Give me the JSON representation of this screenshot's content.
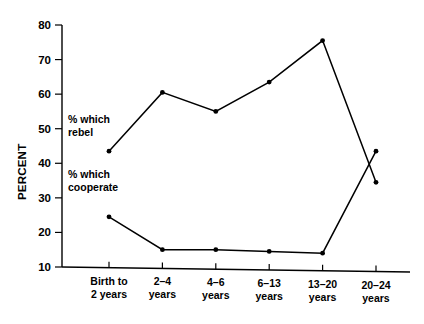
{
  "chart_data": {
    "type": "line",
    "title": "",
    "xlabel": "",
    "ylabel": "PERCENT",
    "ylim": [
      10,
      80
    ],
    "yticks": [
      10,
      20,
      30,
      40,
      50,
      60,
      70,
      80
    ],
    "ytick_labels": [
      "10",
      "20",
      "30",
      "40",
      "50",
      "60",
      "70",
      "80"
    ],
    "grid": false,
    "legend": "inline annotations",
    "categories": [
      "Birth to\n2 years",
      "2–4\nyears",
      "4–6\nyears",
      "6–13\nyears",
      "13–20\nyears",
      "20–24\nyears"
    ],
    "category_lines": [
      [
        "Birth to",
        "2 years"
      ],
      [
        "2–4",
        "years"
      ],
      [
        "4–6",
        "years"
      ],
      [
        "6–13",
        "years"
      ],
      [
        "13–20",
        "years"
      ],
      [
        "20–24",
        "years"
      ]
    ],
    "series": [
      {
        "name": "% which rebel",
        "values": [
          43.5,
          60.5,
          55,
          63.5,
          75.5,
          34.5
        ]
      },
      {
        "name": "% which cooperate",
        "values": [
          24.5,
          15,
          15,
          14.5,
          14,
          43.5
        ]
      }
    ],
    "annotations": [
      {
        "id": "rebel-label",
        "lines": [
          "% which",
          "rebel"
        ],
        "x": 68,
        "y": 123
      },
      {
        "id": "cooperate-label",
        "lines": [
          "% which",
          "cooperate"
        ],
        "x": 68,
        "y": 178
      }
    ]
  }
}
